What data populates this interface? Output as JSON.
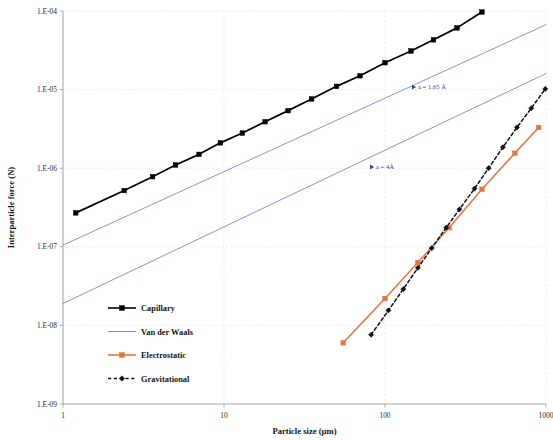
{
  "chart_data": {
    "type": "line",
    "title": "",
    "xlabel": "Particle size (µm)",
    "ylabel": "Interparticle force (N)",
    "xscale": "log",
    "yscale": "log",
    "xlim": [
      1,
      1000
    ],
    "ylim": [
      1e-09,
      0.0001
    ],
    "xticks": [
      1,
      10,
      100,
      1000
    ],
    "xtick_labels": [
      "1",
      "10",
      "100",
      "1000"
    ],
    "yticks": [
      0.0001,
      1e-05,
      1e-06,
      1e-07,
      1e-08,
      1e-09
    ],
    "ytick_labels": [
      "1.E-04",
      "1.E-05",
      "1.E-06",
      "1.E-07",
      "1.E-08",
      "1.E-09"
    ],
    "grid": true,
    "legend_position": "lower-left-inside",
    "series": [
      {
        "name": "Capillary",
        "color": "#000000",
        "marker": "square",
        "linestyle": "solid",
        "x": [
          1.2,
          2.4,
          3.6,
          5.0,
          7.0,
          9.5,
          13,
          18,
          25,
          35,
          50,
          70,
          100,
          145,
          200,
          280,
          400
        ],
        "y": [
          2.7e-07,
          5.2e-07,
          7.8e-07,
          1.1e-06,
          1.5e-06,
          2.1e-06,
          2.8e-06,
          3.9e-06,
          5.4e-06,
          7.6e-06,
          1.1e-05,
          1.5e-05,
          2.2e-05,
          3.1e-05,
          4.3e-05,
          6.1e-05,
          9.7e-05
        ]
      },
      {
        "name": "Van der Waals",
        "color": "#6b85d6",
        "marker": "none",
        "linestyle": "solid",
        "annotation": "a = 1.65 Å",
        "x": [
          1,
          1000
        ],
        "y": [
          1.05e-07,
          6.7e-05
        ]
      },
      {
        "name": "Van der Waals (a = 4 A)",
        "color": "#6b85d6",
        "marker": "none",
        "linestyle": "solid",
        "annotation": "a = 4Å",
        "x": [
          1,
          1000
        ],
        "y": [
          1.9e-08,
          1.6e-05
        ]
      },
      {
        "name": "Electrostatic",
        "color": "#e8743b",
        "marker": "square",
        "linestyle": "solid",
        "x": [
          55,
          100,
          160,
          250,
          400,
          640,
          900
        ],
        "y": [
          6e-09,
          2.2e-08,
          6.3e-08,
          1.75e-07,
          5.4e-07,
          1.55e-06,
          3.3e-06
        ]
      },
      {
        "name": "Gravitational",
        "color": "#111111",
        "marker": "diamond",
        "linestyle": "dashed",
        "x": [
          82,
          105,
          130,
          160,
          195,
          240,
          290,
          360,
          440,
          540,
          660,
          810,
          990
        ],
        "y": [
          7.6e-09,
          1.55e-08,
          2.9e-08,
          5.4e-08,
          9.6e-08,
          1.75e-07,
          3e-07,
          5.5e-07,
          1e-06,
          1.85e-06,
          3.3e-06,
          5.8e-06,
          1.02e-05
        ]
      }
    ],
    "annotations": [
      {
        "text": "a = 1.65 Å",
        "x_px": 418,
        "y_px": 87,
        "marker": "triangle-right",
        "color": "#3a4a78"
      },
      {
        "text": "a = 4Å",
        "x_px": 376,
        "y_px": 167,
        "marker": "triangle-right",
        "color": "#3a4a78"
      }
    ],
    "legend": [
      {
        "label": "Capillary",
        "color": "#000000",
        "marker": "square",
        "linestyle": "solid"
      },
      {
        "label": "Van der Waals",
        "color": "#6b85d6",
        "marker": "none",
        "linestyle": "solid"
      },
      {
        "label": "Electrostatic",
        "color": "#e8743b",
        "marker": "square",
        "linestyle": "solid"
      },
      {
        "label": "Gravitational",
        "color": "#111111",
        "marker": "diamond",
        "linestyle": "dashed"
      }
    ]
  }
}
